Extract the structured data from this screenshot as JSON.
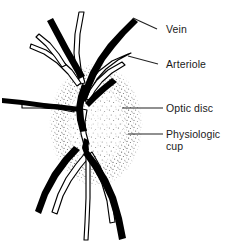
{
  "figure": {
    "background_color": "#ffffff",
    "ink_color": "#000000",
    "label_color": "#1a1a1a",
    "width": 229,
    "height": 241
  },
  "labels": [
    {
      "id": "vein",
      "text": "Vein",
      "x": 168,
      "y": 32,
      "leader": {
        "x1": 157,
        "y1": 29,
        "x2": 133,
        "y2": 18
      },
      "target": "thick-black-vessel-upper-right"
    },
    {
      "id": "arteriole",
      "text": "Arteriole",
      "x": 168,
      "y": 68,
      "leader": {
        "x1": 158,
        "y1": 64,
        "x2": 128,
        "y2": 56
      },
      "target": "outlined-white-vessel-upper-right"
    },
    {
      "id": "optic-disc",
      "text": "Optic disc",
      "x": 168,
      "y": 111,
      "leader": {
        "x1": 163,
        "y1": 108,
        "x2": 122,
        "y2": 108
      },
      "target": "outer-stippled-oval"
    },
    {
      "id": "physiologic-cup",
      "text": "Physiologic",
      "text_line2": "cup",
      "x": 168,
      "y": 137,
      "y2": 149,
      "leader": {
        "x1": 163,
        "y1": 134,
        "x2": 128,
        "y2": 134
      },
      "target": "inner-stippled-oval"
    }
  ],
  "structures": {
    "optic_disc": {
      "name": "optic disc",
      "shape": "stippled oval",
      "center_x": 96,
      "center_y": 125,
      "radius_x": 47,
      "radius_y": 62
    },
    "physiologic_cup": {
      "name": "physiologic cup",
      "shape": "inner stippled oval",
      "center_x": 96,
      "center_y": 124,
      "radius_x": 28,
      "radius_y": 42
    },
    "veins": {
      "name": "vein",
      "rendering": "solid black thick strokes",
      "count": 7
    },
    "arterioles": {
      "name": "arteriole",
      "rendering": "white fill with thin black outline",
      "count": 8
    }
  }
}
